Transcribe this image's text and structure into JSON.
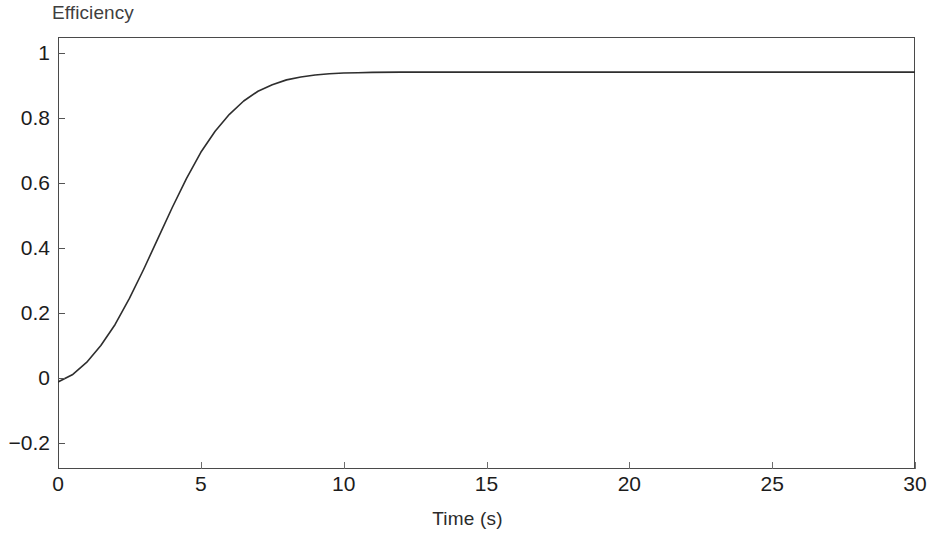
{
  "chart_data": {
    "type": "line",
    "title": "Efficiency",
    "xlabel": "Time (s)",
    "ylabel": "",
    "xlim": [
      0,
      30
    ],
    "ylim": [
      -0.28,
      1.05
    ],
    "grid": false,
    "legend": "none",
    "xticks": [
      "0",
      "5",
      "10",
      "15",
      "20",
      "25",
      "30"
    ],
    "xtick_values": [
      0,
      5,
      10,
      15,
      20,
      25,
      30
    ],
    "yticks": [
      "1",
      "0.8",
      "0.6",
      "0.4",
      "0.2",
      "0",
      "−0.2"
    ],
    "ytick_values": [
      1,
      0.8,
      0.6,
      0.4,
      0.2,
      0,
      -0.2
    ],
    "line_color": "#2e2e2e",
    "line_width": 1.6,
    "series": [
      {
        "name": "Efficiency",
        "x": [
          0,
          0.5,
          1,
          1.5,
          2,
          2.5,
          3,
          3.5,
          4,
          4.5,
          5,
          5.5,
          6,
          6.5,
          7,
          7.5,
          8,
          8.5,
          9,
          9.5,
          10,
          10.5,
          11,
          12,
          13,
          14,
          15,
          16,
          17,
          18,
          20,
          22,
          24,
          26,
          28,
          30
        ],
        "y": [
          -0.012,
          0.01,
          0.048,
          0.1,
          0.165,
          0.245,
          0.335,
          0.43,
          0.525,
          0.615,
          0.695,
          0.76,
          0.812,
          0.853,
          0.883,
          0.903,
          0.918,
          0.927,
          0.933,
          0.937,
          0.939,
          0.94,
          0.941,
          0.942,
          0.942,
          0.942,
          0.942,
          0.942,
          0.942,
          0.942,
          0.942,
          0.942,
          0.942,
          0.942,
          0.942,
          0.942
        ]
      }
    ],
    "annotations": []
  },
  "figure": {
    "background_color": "#ffffff",
    "frame_color": "#4a4a4a",
    "title_color": "#3f3f3f",
    "tick_label_color": "#1c1c1c"
  }
}
